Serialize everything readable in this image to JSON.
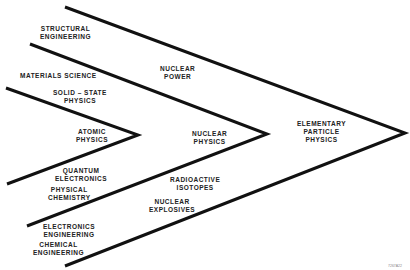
{
  "diagram": {
    "type": "nested-chevrons",
    "line_color": "#111111",
    "chevrons": [
      {
        "name": "inner",
        "apex_label": [
          "ATOMIC",
          "PHYSICS"
        ]
      },
      {
        "name": "middle",
        "apex_label": [
          "NUCLEAR",
          "PHYSICS"
        ]
      },
      {
        "name": "outer",
        "apex_label": [
          "ELEMENTARY",
          "PARTICLE",
          "PHYSICS"
        ]
      }
    ],
    "labels": {
      "structural_engineering": [
        "STRUCTURAL",
        "ENGINEERING"
      ],
      "materials_science": [
        "MATERIALS  SCIENCE"
      ],
      "solid_state_physics": [
        "SOLID – STATE",
        "PHYSICS"
      ],
      "nuclear_power": [
        "NUCLEAR",
        "POWER"
      ],
      "atomic_physics": [
        "ATOMIC",
        "PHYSICS"
      ],
      "nuclear_physics": [
        "NUCLEAR",
        "PHYSICS"
      ],
      "elementary_particle_physics": [
        "ELEMENTARY",
        "PARTICLE",
        "PHYSICS"
      ],
      "quantum_electronics": [
        "QUANTUM",
        "ELECTRONICS"
      ],
      "physical_chemistry": [
        "PHYSICAL",
        "CHEMISTRY"
      ],
      "radioactive_isotopes": [
        "RADIOACTIVE",
        "ISOTOPES"
      ],
      "nuclear_explosives": [
        "NUCLEAR",
        "EXPLOSIVES"
      ],
      "electronics_engineering": [
        "ELECTRONICS",
        "ENGINEERING"
      ],
      "chemical_engineering": [
        "CHEMICAL",
        "ENGINEERING"
      ]
    },
    "figure_id": "7267A22"
  }
}
